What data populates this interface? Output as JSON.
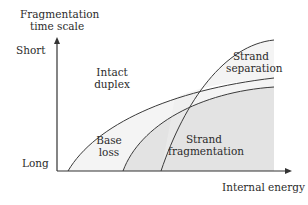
{
  "diagram": {
    "y_axis_label_line1": "Fragmentation",
    "y_axis_label_line2": "time scale",
    "x_axis_label": "Internal energy",
    "y_top_label": "Short",
    "y_bottom_label": "Long",
    "regions": [
      {
        "line1": "Intact",
        "line2": "duplex"
      },
      {
        "line1": "Strand",
        "line2": "separation"
      },
      {
        "line1": "Base",
        "line2": "loss"
      },
      {
        "line1": "Strand",
        "line2": "fragmentation"
      }
    ],
    "colors": {
      "line": "#3a3a3a",
      "shade_light": "#f1f1f1",
      "shade_dark": "#e2e2e2"
    }
  }
}
